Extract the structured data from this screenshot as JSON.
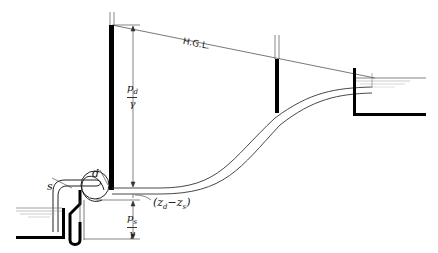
{
  "diagram": {
    "labels": {
      "hgl": "H.G.L.",
      "suction": "s",
      "discharge": "d",
      "elevation_diff_open": "(z",
      "elevation_diff_d": "d",
      "elevation_diff_minus": "−z",
      "elevation_diff_s": "s",
      "elevation_diff_close": ")",
      "pd_num": "p",
      "pd_sub": "d",
      "pd_den": "γ",
      "ps_num": "p",
      "ps_sub": "s",
      "ps_den": "γ"
    },
    "colors": {
      "line": "#222222",
      "fill": "#000000",
      "water": "#888888",
      "background": "#ffffff"
    }
  }
}
